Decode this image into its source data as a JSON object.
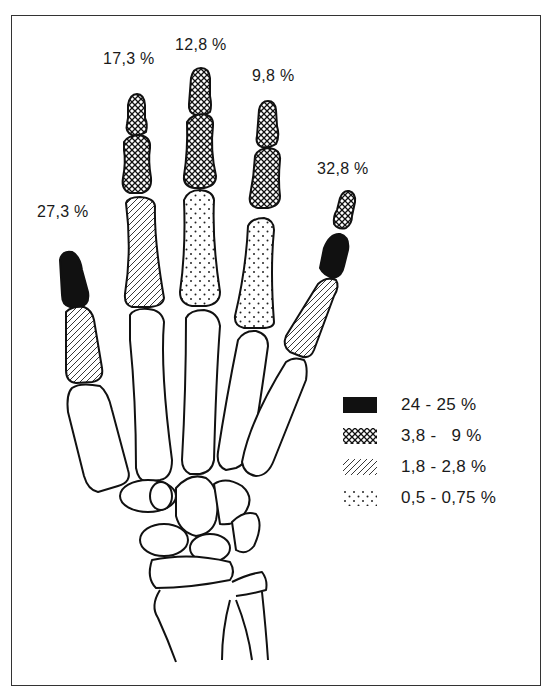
{
  "figure": {
    "type": "anatomical hand skeleton diagram",
    "digit_labels": [
      {
        "digit": "thumb",
        "label": "27,3 %"
      },
      {
        "digit": "index",
        "label": "17,3 %"
      },
      {
        "digit": "middle",
        "label": "12,8 %"
      },
      {
        "digit": "ring",
        "label": "9,8 %"
      },
      {
        "digit": "little",
        "label": "32,8 %"
      }
    ],
    "legend": [
      {
        "pattern": "solid-black",
        "label": "24 - 25 %"
      },
      {
        "pattern": "crosshatch",
        "label": "3,8 -   9 %"
      },
      {
        "pattern": "diagonal-hatch",
        "label": "1,8 - 2,8 %"
      },
      {
        "pattern": "dotted",
        "label": "0,5 - 0,75 %"
      }
    ],
    "colors": {
      "ink": "#111111",
      "background": "#ffffff",
      "frame": "#333333"
    }
  }
}
